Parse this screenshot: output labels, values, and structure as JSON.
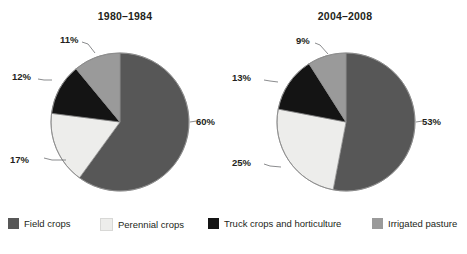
{
  "chart_data": [
    {
      "type": "pie",
      "title": "1980–1984",
      "categories": [
        "Field crops",
        "Perennial crops",
        "Truck crops and horticulture",
        "Irrigated pasture"
      ],
      "values": [
        60,
        17,
        12,
        11
      ],
      "labels": [
        "60%",
        "17%",
        "12%",
        "11%"
      ],
      "colors": [
        "#575757",
        "#ededeb",
        "#141414",
        "#9a9a9a"
      ],
      "unit": "percent",
      "start_angle_deg": 0,
      "direction": "clockwise",
      "xlabel": "",
      "ylabel": "",
      "grid": false,
      "legend_position": "bottom"
    },
    {
      "type": "pie",
      "title": "2004–2008",
      "categories": [
        "Field crops",
        "Perennial crops",
        "Truck crops and horticulture",
        "Irrigated pasture"
      ],
      "values": [
        53,
        25,
        13,
        9
      ],
      "labels": [
        "53%",
        "25%",
        "13%",
        "9%"
      ],
      "colors": [
        "#575757",
        "#ededeb",
        "#141414",
        "#9a9a9a"
      ],
      "unit": "percent",
      "start_angle_deg": 0,
      "direction": "clockwise",
      "xlabel": "",
      "ylabel": "",
      "grid": false,
      "legend_position": "bottom"
    }
  ],
  "charts": {
    "left": {
      "title": "1980–1984",
      "slices": {
        "field": "60%",
        "perennial": "17%",
        "truck": "12%",
        "pasture": "11%"
      }
    },
    "right": {
      "title": "2004–2008",
      "slices": {
        "field": "53%",
        "perennial": "25%",
        "truck": "13%",
        "pasture": "9%"
      }
    }
  },
  "legend": {
    "items": [
      {
        "label": "Field crops",
        "color": "#575757"
      },
      {
        "label": "Perennial crops",
        "color": "#ededeb"
      },
      {
        "label": "Truck crops and horticulture",
        "color": "#141414"
      },
      {
        "label": "Irrigated pasture",
        "color": "#9a9a9a"
      }
    ]
  },
  "colors": {
    "field_crops": "#575757",
    "perennial_crops": "#ededeb",
    "truck_crops": "#141414",
    "irrigated_pasture": "#9a9a9a",
    "outline": "#808080",
    "leader_line": "#6d6e71",
    "text": "#231f20",
    "background": "#ffffff"
  }
}
